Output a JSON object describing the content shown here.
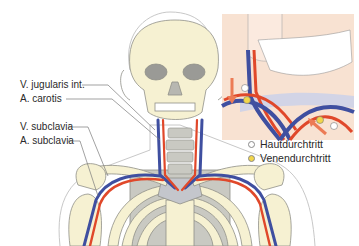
{
  "labels": {
    "v_jugularis": "V. jugularis int.",
    "a_carotis": "A. carotis",
    "v_subclavia": "V. subclavia",
    "a_subclavia": "A. subclavia"
  },
  "legend": {
    "items": [
      {
        "label": "Hautdurchtritt",
        "color": "#ffffff"
      },
      {
        "label": "Venendurchtritt",
        "color": "#f2d64a"
      }
    ]
  },
  "colors": {
    "bone": "#f6f1d2",
    "bone_shadow": "#c9c9c2",
    "artery": "#e0482a",
    "vein": "#3f4fa0",
    "skin": "#f8e2d2",
    "arrow": "#ec7b55",
    "outline": "#9a9a9a"
  }
}
